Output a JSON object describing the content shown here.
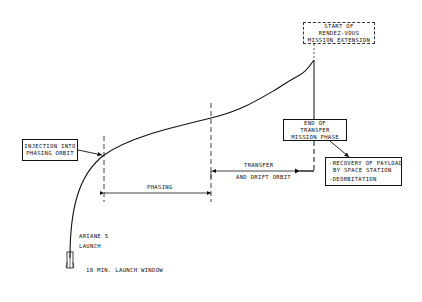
{
  "diagram": {
    "type": "mission-profile",
    "line_color": "#111111",
    "background": "#ffffff",
    "boxes": {
      "start_extension": {
        "lines": [
          "START OF",
          "RENDEZ-VOUS",
          "MISSION EXTENSION"
        ],
        "style": "dashed"
      },
      "end_transfer": {
        "lines": [
          "END OF",
          "TRANSFER",
          "MISSION PHASE"
        ],
        "style": "solid"
      },
      "recovery": {
        "lines": [
          "-RECOVERY OF PAYLOAD",
          "BY SPACE STATION",
          "-DEORBITATION"
        ],
        "style": "solid"
      },
      "injection": {
        "lines": [
          "INJECTION INTO",
          "PHASING ORBIT"
        ],
        "style": "solid"
      }
    },
    "spans": {
      "phasing": "PHASING",
      "transfer_top": "TRANSFER",
      "transfer_bottom": "AND DRIFT ORBIT"
    },
    "launch": {
      "line1": "ARIANE 5",
      "line2": "LAUNCH",
      "window": "10 MIN. LAUNCH WINDOW",
      "icon": "rocket-icon"
    }
  }
}
